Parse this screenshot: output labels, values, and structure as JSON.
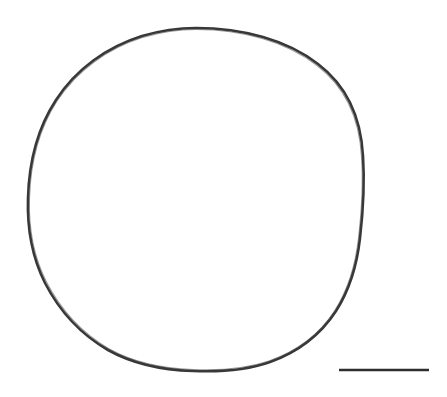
{
  "figure": {
    "title": "Specimen outline drawing",
    "background_color": "#ffffff",
    "width": 447,
    "height": 397,
    "description": "Line drawing of a single large circular specimen outline with a horizontal scale bar at lower right. No text labels are present in the image."
  },
  "specimen_outline": {
    "name": "circular specimen outline",
    "stroke_color": "#383838",
    "stroke_width": 2.6,
    "fill": "none",
    "center_x": 195,
    "center_y": 199,
    "radius_x": 167,
    "radius_y": 171,
    "style": "hand-drawn, slightly irregular closed curve"
  },
  "scale_bar": {
    "name": "scale bar",
    "stroke_color": "#2e2e2e",
    "x_start": 339,
    "x_end": 429,
    "y": 370,
    "thickness": 2.4,
    "length_px": 90,
    "label": ""
  }
}
